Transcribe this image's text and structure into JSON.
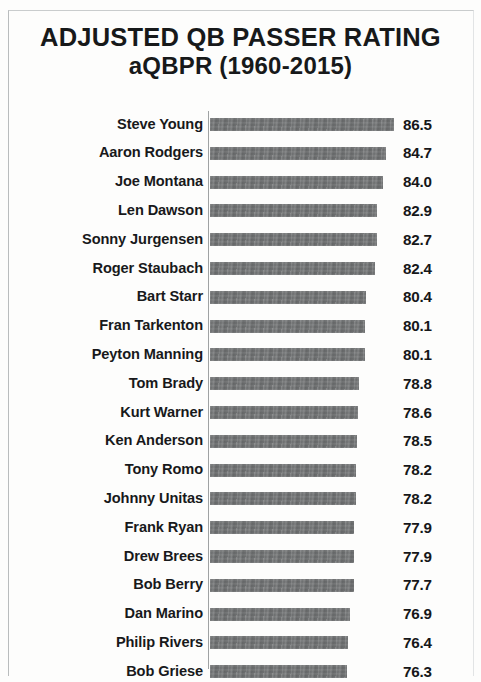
{
  "chart_data": {
    "type": "bar",
    "orientation": "horizontal",
    "title": "ADJUSTED QB PASSER RATING aQBPR (1960-2015)",
    "title_lines": [
      "ADJUSTED QB PASSER RATING",
      "aQBPR (1960-2015)"
    ],
    "xlabel": "",
    "ylabel": "",
    "grid": false,
    "legend": null,
    "xlim": [
      46.5,
      88.5
    ],
    "bar_color": "#6e7071",
    "text_color": "#17191a",
    "background_color": "#fdfdfc",
    "categories": [
      "Steve Young",
      "Aaron Rodgers",
      "Joe Montana",
      "Len Dawson",
      "Sonny Jurgensen",
      "Roger Staubach",
      "Bart Starr",
      "Fran Tarkenton",
      "Peyton Manning",
      "Tom Brady",
      "Kurt Warner",
      "Ken Anderson",
      "Tony Romo",
      "Johnny Unitas",
      "Frank Ryan",
      "Drew Brees",
      "Bob Berry",
      "Dan Marino",
      "Philip Rivers",
      "Bob Griese"
    ],
    "values": [
      86.5,
      84.7,
      84.0,
      82.9,
      82.7,
      82.4,
      80.4,
      80.1,
      80.1,
      78.8,
      78.6,
      78.5,
      78.2,
      78.2,
      77.9,
      77.9,
      77.7,
      76.9,
      76.4,
      76.3
    ],
    "value_labels": [
      "86.5",
      "84.7",
      "84.0",
      "82.9",
      "82.7",
      "82.4",
      "80.4",
      "80.1",
      "80.1",
      "78.8",
      "78.6",
      "78.5",
      "78.2",
      "78.2",
      "77.9",
      "77.9",
      "77.7",
      "76.9",
      "76.4",
      "76.3"
    ]
  },
  "rows": [
    {
      "name": "Steve Young",
      "value": 86.5,
      "label": "86.5"
    },
    {
      "name": "Aaron Rodgers",
      "value": 84.7,
      "label": "84.7"
    },
    {
      "name": "Joe Montana",
      "value": 84.0,
      "label": "84.0"
    },
    {
      "name": "Len Dawson",
      "value": 82.9,
      "label": "82.9"
    },
    {
      "name": "Sonny Jurgensen",
      "value": 82.7,
      "label": "82.7"
    },
    {
      "name": "Roger Staubach",
      "value": 82.4,
      "label": "82.4"
    },
    {
      "name": "Bart Starr",
      "value": 80.4,
      "label": "80.4"
    },
    {
      "name": "Fran Tarkenton",
      "value": 80.1,
      "label": "80.1"
    },
    {
      "name": "Peyton Manning",
      "value": 80.1,
      "label": "80.1"
    },
    {
      "name": "Tom Brady",
      "value": 78.8,
      "label": "78.8"
    },
    {
      "name": "Kurt Warner",
      "value": 78.6,
      "label": "78.6"
    },
    {
      "name": "Ken Anderson",
      "value": 78.5,
      "label": "78.5"
    },
    {
      "name": "Tony Romo",
      "value": 78.2,
      "label": "78.2"
    },
    {
      "name": "Johnny Unitas",
      "value": 78.2,
      "label": "78.2"
    },
    {
      "name": "Frank Ryan",
      "value": 77.9,
      "label": "77.9"
    },
    {
      "name": "Drew Brees",
      "value": 77.9,
      "label": "77.9"
    },
    {
      "name": "Bob Berry",
      "value": 77.7,
      "label": "77.7"
    },
    {
      "name": "Dan Marino",
      "value": 76.9,
      "label": "76.9"
    },
    {
      "name": "Philip Rivers",
      "value": 76.4,
      "label": "76.4"
    },
    {
      "name": "Bob Griese",
      "value": 76.3,
      "label": "76.3"
    }
  ],
  "title": {
    "line1": "ADJUSTED QB PASSER RATING",
    "line2": "aQBPR (1960-2015)"
  }
}
